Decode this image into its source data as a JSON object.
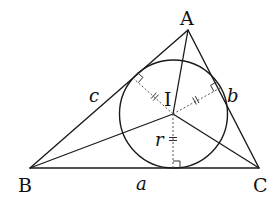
{
  "diagram": {
    "vertices": {
      "A": {
        "label": "A",
        "x": 188,
        "y": 30
      },
      "B": {
        "label": "B",
        "x": 30,
        "y": 168
      },
      "C": {
        "label": "C",
        "x": 259,
        "y": 168
      }
    },
    "incenter": {
      "label": "I",
      "x": 173,
      "y": 114
    },
    "inradius": {
      "label": "r",
      "value_px": 54
    },
    "sides": {
      "a": {
        "label": "a",
        "between": "B-C"
      },
      "b": {
        "label": "b",
        "between": "A-C"
      },
      "c": {
        "label": "c",
        "between": "A-B"
      }
    },
    "tangent_points": [
      {
        "side": "BC",
        "x": 173,
        "y": 168
      },
      {
        "side": "AC",
        "x": 220,
        "y": 88
      },
      {
        "side": "AB",
        "x": 133,
        "y": 78
      }
    ],
    "annotations": {
      "equal_radius_ticks": "double tick marks on each radius",
      "right_angle_markers": 3
    },
    "colors": {
      "stroke": "#1a1a1a",
      "dashed_radius": "#555555",
      "background": "#ffffff"
    }
  }
}
